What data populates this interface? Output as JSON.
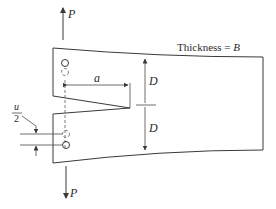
{
  "diagram": {
    "type": "double-cantilever-beam fracture specimen",
    "labels": {
      "load_top": "P",
      "load_bottom": "P",
      "crack_length": "a",
      "half_height_upper": "D",
      "half_height_lower": "D",
      "thickness_text": "Thickness = ",
      "thickness_symbol": "B",
      "displacement_num": "u",
      "displacement_den": "2"
    },
    "colors": {
      "line": "#3a3a3a",
      "background": "#ffffff"
    }
  }
}
